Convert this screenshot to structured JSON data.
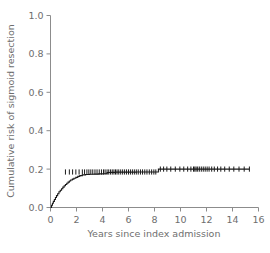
{
  "chart_data": {
    "type": "line",
    "title": "",
    "subtitle": "",
    "xlabel": "Years since index admission",
    "ylabel": "Cumulative risk of sigmoid resection",
    "xlim": [
      0,
      16
    ],
    "ylim": [
      0.0,
      1.0
    ],
    "xticks": [
      0,
      2,
      4,
      6,
      8,
      10,
      12,
      14,
      16
    ],
    "xtick_labels": [
      "0",
      "2",
      "4",
      "6",
      "8",
      "10",
      "12",
      "14",
      "16"
    ],
    "yticks": [
      0.0,
      0.2,
      0.4,
      0.6,
      0.8,
      1.0
    ],
    "ytick_labels": [
      "0.0",
      "0.2",
      "0.4",
      "0.6",
      "0.8",
      "1.0"
    ],
    "grid": false,
    "legend": null,
    "legend_position": "none",
    "series": [
      {
        "name": "Cumulative risk of sigmoid resection",
        "style": "step",
        "color": "#1a1a1a",
        "linewidth": 1.1,
        "x": [
          0.0,
          0.08,
          0.15,
          0.22,
          0.3,
          0.38,
          0.46,
          0.55,
          0.65,
          0.75,
          0.85,
          0.95,
          1.05,
          1.15,
          1.25,
          1.35,
          1.45,
          1.55,
          1.68,
          1.8,
          1.95,
          2.1,
          2.25,
          2.45,
          2.7,
          3.0,
          3.35,
          3.7,
          4.05,
          4.35,
          4.6,
          5.0,
          5.5,
          6.0,
          6.6,
          7.2,
          7.8,
          8.25,
          8.3,
          9.0,
          10.0,
          11.0,
          12.0,
          13.0,
          14.0,
          15.3
        ],
        "y": [
          0.0,
          0.012,
          0.022,
          0.032,
          0.042,
          0.052,
          0.062,
          0.072,
          0.082,
          0.09,
          0.098,
          0.106,
          0.113,
          0.12,
          0.126,
          0.132,
          0.138,
          0.143,
          0.148,
          0.152,
          0.157,
          0.162,
          0.166,
          0.17,
          0.172,
          0.173,
          0.174,
          0.175,
          0.176,
          0.182,
          0.183,
          0.184,
          0.184,
          0.184,
          0.185,
          0.185,
          0.185,
          0.185,
          0.2,
          0.2,
          0.2,
          0.2,
          0.2,
          0.2,
          0.2,
          0.2
        ]
      }
    ],
    "censor_marks": {
      "symbol": "vertical-tick",
      "color": "#1a1a1a",
      "x": [
        1.15,
        1.45,
        1.7,
        1.95,
        2.2,
        2.45,
        2.62,
        2.8,
        2.95,
        3.1,
        3.25,
        3.42,
        3.58,
        3.75,
        3.92,
        4.08,
        4.2,
        4.35,
        4.48,
        4.62,
        4.75,
        4.88,
        5.0,
        5.12,
        5.25,
        5.4,
        5.55,
        5.7,
        5.85,
        6.0,
        6.15,
        6.3,
        6.45,
        6.6,
        6.75,
        6.92,
        7.08,
        7.25,
        7.42,
        7.6,
        7.78,
        7.95,
        8.1,
        8.45,
        8.7,
        8.95,
        9.25,
        9.6,
        9.95,
        10.25,
        10.55,
        10.8,
        11.0,
        11.1,
        11.2,
        11.32,
        11.45,
        11.6,
        11.75,
        11.9,
        12.05,
        12.2,
        12.4,
        12.6,
        12.85,
        13.1,
        13.4,
        13.75,
        14.1,
        14.5,
        14.9,
        15.3
      ],
      "y_before_step": 0.185,
      "y_after_step": 0.2,
      "step_x": 8.3
    },
    "annotations": []
  },
  "axes": {
    "x_axis_name": "years-since-index-admission-axis",
    "y_axis_name": "cumulative-risk-axis",
    "tick_color": "#8c8c8c",
    "axis_color": "#8c8c8c",
    "label_color": "#6e6e6e"
  }
}
